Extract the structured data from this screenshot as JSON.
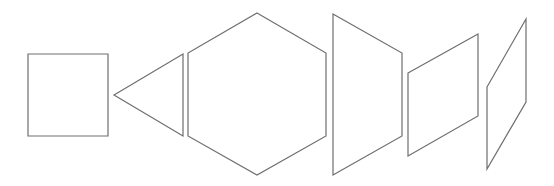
{
  "diagram": {
    "title": "",
    "stroke_color": "#6e6e6e",
    "background": "#ffffff",
    "shapes": [
      {
        "id": "square",
        "type": "square",
        "points": "28,54 108,54 108,136 28,136"
      },
      {
        "id": "triangle",
        "type": "triangle",
        "points": "114,95 183,54 183,136"
      },
      {
        "id": "hexagon",
        "type": "hexagon",
        "points": "257,13 326,53 326,136 257,175 188,136 188,53"
      },
      {
        "id": "trapezoid",
        "type": "trapezoid",
        "points": "333,14 402,53 402,136 333,175"
      },
      {
        "id": "parallelogram-1",
        "type": "parallelogram",
        "points": "408,73 478,34 478,116 408,156"
      },
      {
        "id": "parallelogram-2",
        "type": "parallelogram",
        "points": "487,87 526,19 526,102 487,169"
      }
    ]
  }
}
